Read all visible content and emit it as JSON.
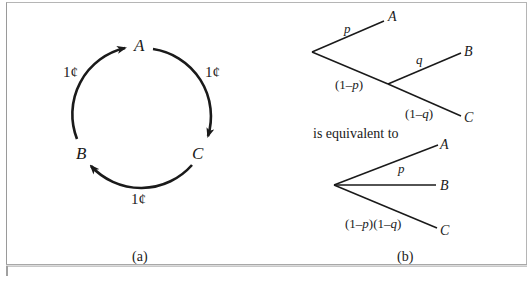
{
  "panel_a": {
    "caption": "(a)",
    "nodes": {
      "A": "A",
      "B": "B",
      "C": "C"
    },
    "edges": [
      {
        "from": "A",
        "to": "C",
        "label": "1¢"
      },
      {
        "from": "C",
        "to": "B",
        "label": "1¢"
      },
      {
        "from": "B",
        "to": "A",
        "label": "1¢"
      }
    ]
  },
  "panel_b": {
    "caption": "(b)",
    "connector_text": "is equivalent to",
    "tree_compound": {
      "leaves": {
        "A": "A",
        "B": "B",
        "C": "C"
      },
      "edge_labels": {
        "p": "p",
        "one_minus_p_open": "(1–",
        "one_minus_p_var": "p",
        "one_minus_p_close": ")",
        "q": "q",
        "one_minus_q_open": "(1–",
        "one_minus_q_var": "q",
        "one_minus_q_close": ")"
      }
    },
    "tree_simple": {
      "leaves": {
        "A": "A",
        "B": "B",
        "C": "C"
      },
      "edge_labels": {
        "p": "p",
        "c_open1": "(1–",
        "c_var1": "p",
        "c_mid": ")(1–",
        "c_var2": "q",
        "c_close": ")"
      }
    }
  },
  "colors": {
    "ink": "#1a1a1a",
    "frame": "#a8a8a8",
    "background": "#ffffff"
  }
}
